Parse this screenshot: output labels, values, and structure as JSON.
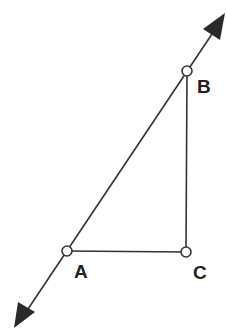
{
  "diagram": {
    "type": "geometry",
    "points": [
      {
        "id": "A",
        "label": "A",
        "x": 67,
        "y": 251
      },
      {
        "id": "B",
        "label": "B",
        "x": 187,
        "y": 71
      },
      {
        "id": "C",
        "label": "C",
        "x": 186,
        "y": 252
      }
    ],
    "segments": [
      {
        "from": "A",
        "to": "C"
      },
      {
        "from": "C",
        "to": "B"
      }
    ],
    "line": {
      "through": [
        "A",
        "B"
      ],
      "arrows": "both"
    },
    "colors": {
      "stroke": "#333333",
      "point_fill": "#ffffff",
      "label": "#222222"
    }
  }
}
